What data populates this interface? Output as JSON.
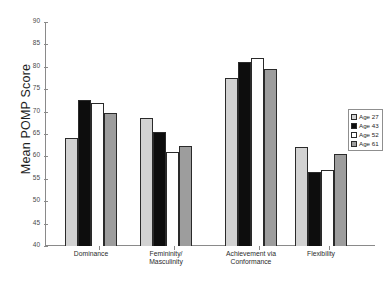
{
  "chart_data": {
    "type": "bar",
    "title": "",
    "xlabel": "",
    "ylabel": "Mean POMP Score",
    "ylim": [
      40,
      90
    ],
    "ytick_step": 5,
    "yticks": [
      90,
      85,
      80,
      75,
      70,
      65,
      60,
      55,
      50,
      45,
      40
    ],
    "grid": false,
    "legend_position": "right",
    "categories": [
      "Dominance",
      "Femininity/ Masculinity",
      "Achievement via Conformance",
      "Flexibility"
    ],
    "series": [
      {
        "name": "Age 27",
        "color": "#d2d2d2",
        "values": [
          64.0,
          68.5,
          77.5,
          62.0
        ]
      },
      {
        "name": "Age 43",
        "color": "#0d0d0d",
        "values": [
          72.7,
          65.5,
          81.0,
          56.5
        ]
      },
      {
        "name": "Age 52",
        "color": "#ffffff",
        "values": [
          72.0,
          61.0,
          82.0,
          57.0
        ]
      },
      {
        "name": "Age 61",
        "color": "#9d9d9d",
        "values": [
          69.8,
          62.3,
          79.6,
          60.5
        ]
      }
    ]
  },
  "legend": {
    "items": [
      "Age 27",
      "Age 43",
      "Age 52",
      "Age 61"
    ]
  },
  "axis": {
    "y_title": "Mean POMP Score"
  }
}
